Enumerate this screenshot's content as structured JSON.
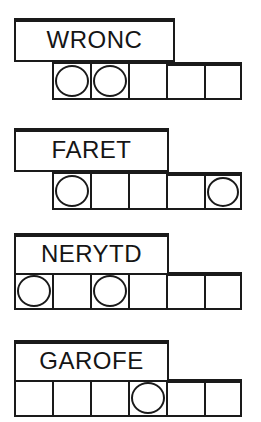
{
  "page": {
    "background_color": "#ffffff",
    "ink_color": "#1a1a1a",
    "width": 261,
    "height": 422
  },
  "puzzles": [
    {
      "id": "puzzle-1",
      "word": "WRONC",
      "word_box": {
        "x": 14,
        "y": 18,
        "width": 161,
        "height": 44
      },
      "grid": {
        "x": 52,
        "y": 62,
        "cell_width": 38,
        "cell_height": 38,
        "cell_count": 5,
        "exposed_from_index": 3
      },
      "circles": [
        true,
        true,
        false,
        false,
        false
      ],
      "circle_cells": [
        1,
        2
      ]
    },
    {
      "id": "puzzle-2",
      "word": "FARET",
      "word_box": {
        "x": 14,
        "y": 128,
        "width": 155,
        "height": 44
      },
      "grid": {
        "x": 52,
        "y": 172,
        "cell_width": 38,
        "cell_height": 38,
        "cell_count": 5,
        "exposed_from_index": 3
      },
      "circles": [
        true,
        false,
        false,
        false,
        true
      ],
      "circle_cells": [
        1,
        5
      ]
    },
    {
      "id": "puzzle-3",
      "word": "NERYTD",
      "word_box": {
        "x": 14,
        "y": 233,
        "width": 155,
        "height": 42
      },
      "grid": {
        "x": 14,
        "y": 272,
        "cell_width": 38,
        "cell_height": 38,
        "cell_count": 6,
        "exposed_from_index": 4
      },
      "circles": [
        true,
        false,
        true,
        false,
        false,
        false
      ],
      "circle_cells": [
        1,
        3
      ]
    },
    {
      "id": "puzzle-4",
      "word": "GAROFE",
      "word_box": {
        "x": 14,
        "y": 340,
        "width": 155,
        "height": 42
      },
      "grid": {
        "x": 14,
        "y": 379,
        "cell_width": 38,
        "cell_height": 38,
        "cell_count": 6,
        "exposed_from_index": 4
      },
      "circles": [
        false,
        false,
        false,
        true,
        false,
        false
      ],
      "circle_cells": [
        4
      ]
    }
  ]
}
